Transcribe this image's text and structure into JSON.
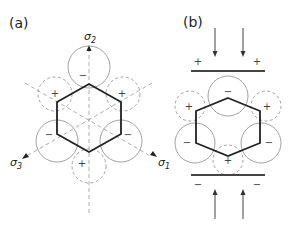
{
  "panels": [
    {
      "label": "(a)",
      "axes": [
        "σ2",
        "σ3",
        "σ1"
      ],
      "axis_names": {
        "sigma2": "σ",
        "sigma2_sub": "2",
        "sigma3": "σ",
        "sigma3_sub": "3",
        "sigma1": "σ",
        "sigma1_sub": "1"
      },
      "signs": {
        "top": "−",
        "upper_left": "+",
        "upper_right": "+",
        "lower_left": "−",
        "lower_right": "−",
        "bottom": "+"
      }
    },
    {
      "label": "(b)",
      "signs": {
        "top": "−",
        "upper_left": "+",
        "upper_right": "+",
        "lower_left": "−",
        "lower_right": "−",
        "bottom": "+"
      },
      "plate_top_signs": [
        "+",
        "+"
      ],
      "plate_bottom_signs": [
        "−",
        "−"
      ]
    }
  ],
  "colors": {
    "hexagon": "#222222",
    "circle": "#888888",
    "axis": "#888888",
    "plate": "#444444"
  }
}
